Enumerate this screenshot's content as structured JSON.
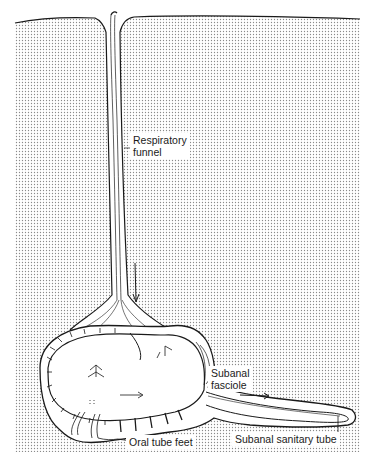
{
  "figure": {
    "colors": {
      "background": "#ffffff",
      "sediment_dots": "#8a8a8a",
      "line": "#1a1a1a"
    }
  },
  "labels": {
    "respiratory_funnel": {
      "line1": "Respiratory",
      "line2": "funnel"
    },
    "subanal_fasciole": {
      "line1": "Subanal",
      "line2": "fasciole"
    },
    "oral_tube_feet": "Oral tube feet",
    "subanal_sanitary_tube": "Subanal sanitary tube"
  }
}
